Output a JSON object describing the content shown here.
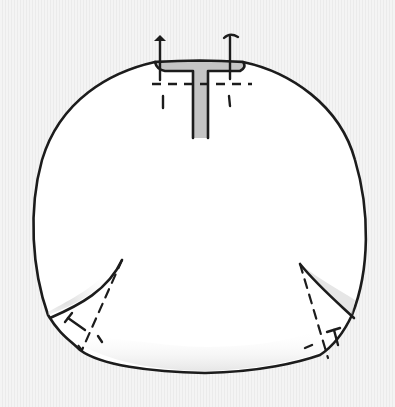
{
  "figure": {
    "colors": {
      "background": "#f1f1f1",
      "stroke": "#1c1c1c",
      "panel_fill": "#ffffff",
      "shading": "#cfcfcf",
      "slot_fill": "#c4c4c4"
    },
    "elements": {
      "outline": "rounded-panel-outline",
      "top_slot": "t-shaped-slot",
      "ties": [
        "left-tie-arrow",
        "right-tie-arrow"
      ],
      "darts": [
        "left-corner-dart",
        "right-corner-dart"
      ]
    }
  }
}
